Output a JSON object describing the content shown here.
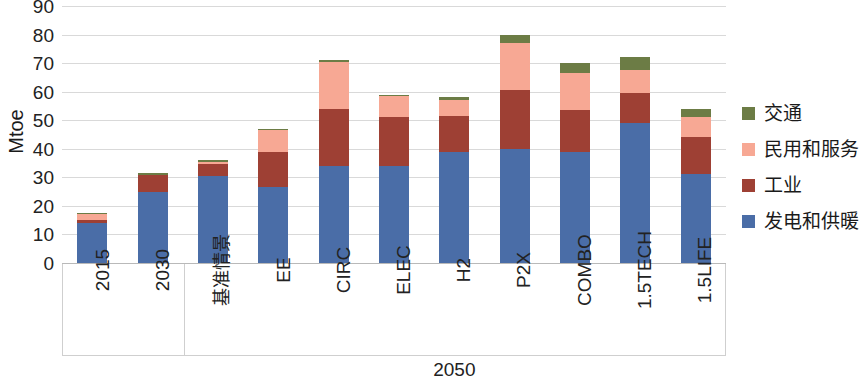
{
  "chart_data": {
    "type": "bar",
    "stacked": true,
    "title": "",
    "subtitle": "",
    "xlabel": "",
    "ylabel": "Mtoe",
    "ylim": [
      0,
      90
    ],
    "yticks": [
      0,
      10,
      20,
      30,
      40,
      50,
      60,
      70,
      80,
      90
    ],
    "grid": true,
    "legend_position": "right",
    "categories": [
      "2015",
      "2030",
      "基准情景",
      "EE",
      "CIRC",
      "ELEC",
      "H2",
      "P2X",
      "COMBO",
      "1.5TECH",
      "1.5LIFE"
    ],
    "group_labels": [
      {
        "label": "2050",
        "from": "基准情景",
        "to": "1.5LIFE"
      }
    ],
    "series": [
      {
        "name": "发电和供暖",
        "color": "#4A6DA7",
        "values": [
          14.0,
          25.0,
          30.5,
          26.5,
          34.0,
          34.0,
          39.0,
          40.0,
          39.0,
          49.0,
          31.0
        ]
      },
      {
        "name": "工业",
        "color": "#9E4034",
        "values": [
          1.0,
          6.0,
          4.0,
          12.5,
          20.0,
          17.0,
          12.5,
          20.5,
          14.5,
          10.5,
          13.0
        ]
      },
      {
        "name": "民用和服务",
        "color": "#F7A894",
        "values": [
          2.0,
          0.0,
          1.0,
          7.5,
          16.5,
          7.5,
          5.5,
          16.5,
          13.0,
          8.0,
          7.0
        ]
      },
      {
        "name": "交通",
        "color": "#6C7C45",
        "values": [
          0.5,
          0.5,
          0.5,
          0.5,
          0.5,
          0.5,
          1.0,
          3.0,
          3.5,
          4.5,
          3.0
        ]
      }
    ],
    "totals": [
      17.5,
      31.5,
      36.0,
      47.0,
      71.0,
      59.0,
      58.0,
      80.0,
      70.0,
      72.0,
      54.0
    ]
  },
  "legend": {
    "items": [
      {
        "label": "交通",
        "color": "#6C7C45"
      },
      {
        "label": "民用和服务",
        "color": "#F7A894"
      },
      {
        "label": "工业",
        "color": "#9E4034"
      },
      {
        "label": "发电和供暖",
        "color": "#4A6DA7"
      }
    ]
  },
  "axis": {
    "y_title": "Mtoe"
  }
}
